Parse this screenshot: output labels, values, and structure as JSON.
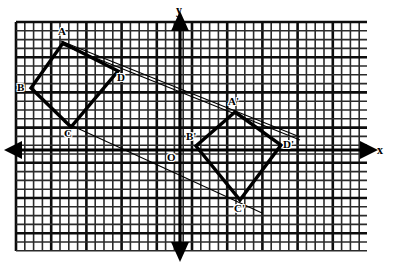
{
  "figure": {
    "background_color": "#ffffff",
    "ink_color": "#111111",
    "grid": {
      "left": 16,
      "top": 22,
      "right": 367,
      "bottom": 251,
      "cell": 8.8,
      "minor_line_color": "#2b2b2b",
      "minor_line_width": 1.6,
      "major_line_color": "#0d0d0d",
      "major_line_width": 2.6,
      "major_every": 4
    },
    "axes": {
      "x_axis_y": 150,
      "y_axis_x": 180,
      "line_color": "#000000",
      "line_width": 3.2,
      "arrow_size": 9,
      "x_label": "x",
      "y_label": "y",
      "origin_label": "O",
      "x_label_pos": {
        "x": 377,
        "y": 144
      },
      "y_label_pos": {
        "x": 176,
        "y": 4
      },
      "origin_label_pos": {
        "x": 167,
        "y": 152
      }
    },
    "shapes": [
      {
        "name": "quadrilateral-abcd",
        "closed": true,
        "stroke_width": 3.4,
        "stroke_color": "#000000",
        "vertices": [
          {
            "label": "A",
            "x": 63,
            "y": 43,
            "label_x": 58,
            "label_y": 26
          },
          {
            "label": "B",
            "x": 31,
            "y": 88,
            "label_x": 17,
            "label_y": 82
          },
          {
            "label": "C",
            "x": 71,
            "y": 127,
            "label_x": 64,
            "label_y": 128
          },
          {
            "label": "D",
            "x": 118,
            "y": 71,
            "label_x": 117,
            "label_y": 72
          }
        ]
      },
      {
        "name": "quadrilateral-a-prime-b-prime-c-prime-d-prime",
        "closed": true,
        "stroke_width": 3.4,
        "stroke_color": "#000000",
        "vertices": [
          {
            "label": "A'",
            "x": 235,
            "y": 112,
            "label_x": 228,
            "label_y": 96
          },
          {
            "label": "B'",
            "x": 196,
            "y": 146,
            "label_x": 186,
            "label_y": 131
          },
          {
            "label": "C'",
            "x": 240,
            "y": 200,
            "label_x": 234,
            "label_y": 203
          },
          {
            "label": "D'",
            "x": 281,
            "y": 145,
            "label_x": 283,
            "label_y": 139
          }
        ]
      }
    ],
    "construction_lines": [
      {
        "name": "line-a-to-a-prime",
        "x1": 61,
        "y1": 41,
        "x2": 300,
        "y2": 137,
        "stroke_width": 1.1
      },
      {
        "name": "line-a-to-d-prime",
        "x1": 63,
        "y1": 45,
        "x2": 300,
        "y2": 140,
        "stroke_width": 1.1
      },
      {
        "name": "line-c-to-c-prime",
        "x1": 64,
        "y1": 122,
        "x2": 262,
        "y2": 213,
        "stroke_width": 1.1
      }
    ]
  }
}
